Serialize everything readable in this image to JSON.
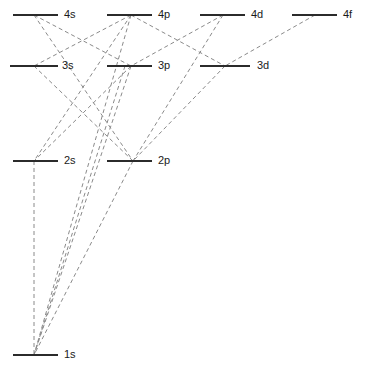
{
  "diagram": {
    "type": "energy-level-transition-diagram",
    "width": 365,
    "height": 368,
    "background_color": "#ffffff",
    "level_line_color": "#2b2b2b",
    "transition_line_color": "#8a8a8a",
    "label_color": "#1a1a1a",
    "transition_style": "dashed"
  },
  "levels": [
    {
      "id": "4s",
      "label": "4s",
      "n": 4,
      "orbital": "s",
      "x1": 13,
      "x2": 58,
      "y": 15,
      "anchor_x": 34,
      "label_x": 64,
      "label_y": 9
    },
    {
      "id": "4p",
      "label": "4p",
      "n": 4,
      "orbital": "p",
      "x1": 107,
      "x2": 152,
      "y": 15,
      "anchor_x": 131,
      "label_x": 158,
      "label_y": 9
    },
    {
      "id": "4d",
      "label": "4d",
      "n": 4,
      "orbital": "d",
      "x1": 200,
      "x2": 245,
      "y": 15,
      "anchor_x": 223,
      "label_x": 251,
      "label_y": 9
    },
    {
      "id": "4f",
      "label": "4f",
      "n": 4,
      "orbital": "f",
      "x1": 292,
      "x2": 337,
      "y": 15,
      "anchor_x": 315,
      "label_x": 343,
      "label_y": 9
    },
    {
      "id": "3s",
      "label": "3s",
      "n": 3,
      "orbital": "s",
      "x1": 10,
      "x2": 58,
      "y": 66,
      "anchor_x": 34,
      "label_x": 62,
      "label_y": 60
    },
    {
      "id": "3p",
      "label": "3p",
      "n": 3,
      "orbital": "p",
      "x1": 107,
      "x2": 152,
      "y": 66,
      "anchor_x": 131,
      "label_x": 158,
      "label_y": 60
    },
    {
      "id": "3d",
      "label": "3d",
      "n": 3,
      "orbital": "d",
      "x1": 200,
      "x2": 250,
      "y": 66,
      "anchor_x": 225,
      "label_x": 257,
      "label_y": 60
    },
    {
      "id": "2s",
      "label": "2s",
      "n": 2,
      "orbital": "s",
      "x1": 13,
      "x2": 58,
      "y": 161,
      "anchor_x": 34,
      "label_x": 64,
      "label_y": 155
    },
    {
      "id": "2p",
      "label": "2p",
      "n": 2,
      "orbital": "p",
      "x1": 107,
      "x2": 152,
      "y": 161,
      "anchor_x": 133,
      "label_x": 158,
      "label_y": 155
    },
    {
      "id": "1s",
      "label": "1s",
      "n": 1,
      "orbital": "s",
      "x1": 13,
      "x2": 58,
      "y": 355,
      "anchor_x": 34,
      "label_x": 64,
      "label_y": 349
    }
  ],
  "transitions": [
    {
      "from": "4s",
      "to": "3p"
    },
    {
      "from": "4s",
      "to": "2p"
    },
    {
      "from": "4p",
      "to": "3s"
    },
    {
      "from": "4p",
      "to": "3d"
    },
    {
      "from": "4p",
      "to": "2s"
    },
    {
      "from": "4p",
      "to": "1s"
    },
    {
      "from": "4d",
      "to": "3p"
    },
    {
      "from": "4d",
      "to": "2p"
    },
    {
      "from": "4f",
      "to": "3d"
    },
    {
      "from": "3s",
      "to": "2p"
    },
    {
      "from": "3p",
      "to": "2s"
    },
    {
      "from": "3p",
      "to": "1s"
    },
    {
      "from": "3d",
      "to": "2p"
    },
    {
      "from": "2p",
      "to": "1s"
    },
    {
      "from": "4s",
      "to": "2p2"
    },
    {
      "from": "3s",
      "to": "2p2"
    }
  ],
  "transition_segments": [
    {
      "name": "4s-3p",
      "x1": 34,
      "y1": 15,
      "x2": 131,
      "y2": 66
    },
    {
      "name": "4s-2p",
      "x1": 34,
      "y1": 15,
      "x2": 133,
      "y2": 161
    },
    {
      "name": "4p-3s",
      "x1": 131,
      "y1": 15,
      "x2": 34,
      "y2": 66
    },
    {
      "name": "4p-3d",
      "x1": 131,
      "y1": 15,
      "x2": 225,
      "y2": 66
    },
    {
      "name": "4p-2s",
      "x1": 131,
      "y1": 15,
      "x2": 34,
      "y2": 161
    },
    {
      "name": "4p-1s",
      "x1": 131,
      "y1": 15,
      "x2": 34,
      "y2": 355
    },
    {
      "name": "4d-3p",
      "x1": 223,
      "y1": 15,
      "x2": 131,
      "y2": 66
    },
    {
      "name": "4d-2p",
      "x1": 223,
      "y1": 15,
      "x2": 133,
      "y2": 161
    },
    {
      "name": "4f-3d",
      "x1": 315,
      "y1": 15,
      "x2": 225,
      "y2": 66
    },
    {
      "name": "3s-2p",
      "x1": 34,
      "y1": 66,
      "x2": 133,
      "y2": 161
    },
    {
      "name": "3p-2s",
      "x1": 131,
      "y1": 66,
      "x2": 34,
      "y2": 161
    },
    {
      "name": "3p-1s",
      "x1": 131,
      "y1": 66,
      "x2": 34,
      "y2": 355
    },
    {
      "name": "3d-2p",
      "x1": 225,
      "y1": 66,
      "x2": 133,
      "y2": 161
    },
    {
      "name": "2p-1s",
      "x1": 133,
      "y1": 161,
      "x2": 34,
      "y2": 355
    },
    {
      "name": "4s-1s-via-2p",
      "x1": 125,
      "y1": 66,
      "x2": 34,
      "y2": 355
    },
    {
      "name": "2s-down",
      "x1": 34,
      "y1": 161,
      "x2": 34,
      "y2": 355
    }
  ]
}
